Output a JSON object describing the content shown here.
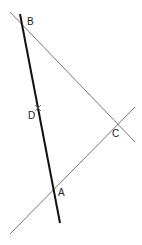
{
  "diagram": {
    "type": "geometry-construction",
    "points": {
      "A": {
        "label": "A",
        "x": 53,
        "y": 191,
        "label_x": 58,
        "label_y": 196
      },
      "B": {
        "label": "B",
        "x": 21,
        "y": 22,
        "label_x": 27,
        "label_y": 25
      },
      "C": {
        "label": "C",
        "x": 115,
        "y": 124,
        "label_x": 112,
        "label_y": 137
      },
      "D": {
        "label": "D",
        "x": 38,
        "y": 108,
        "label_x": 28,
        "label_y": 119
      }
    },
    "lines": [
      {
        "name": "line-BA-thick",
        "x1": 20,
        "y1": 14,
        "x2": 60,
        "y2": 223,
        "color": "#111111",
        "width": 2
      },
      {
        "name": "line-BC",
        "x1": 10,
        "y1": 12,
        "x2": 135,
        "y2": 142,
        "color": "#777777",
        "width": 1
      },
      {
        "name": "line-AC",
        "x1": 10,
        "y1": 234,
        "x2": 135,
        "y2": 107,
        "color": "#777777",
        "width": 1
      }
    ],
    "marker": {
      "name": "D-cross-mark",
      "x": 38,
      "y": 108,
      "size": 3,
      "color": "#555555"
    }
  }
}
